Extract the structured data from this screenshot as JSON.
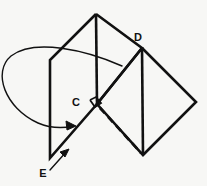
{
  "figure": {
    "background_color": "#f7f7f5",
    "stroke_color": "#111111",
    "canvas": {
      "width": 207,
      "height": 186
    },
    "labels": [
      {
        "id": "label-D",
        "text": "D",
        "x": 138,
        "y": 41
      },
      {
        "id": "label-C",
        "text": "C",
        "x": 76,
        "y": 106
      },
      {
        "id": "label-E",
        "text": "E",
        "x": 43,
        "y": 177
      }
    ],
    "shapes": {
      "left_plane": {
        "name": "left-rhombus",
        "points": "96,14 142,48 97,104 50,158 50,60 96,14",
        "outline": "96,14 50,60 50,158 97,104 142,48 96,14",
        "stroke_width": 2.6
      },
      "right_plane": {
        "name": "right-rhombus",
        "outline": "142,48 196,102 143,155 97,104 142,48",
        "stroke_width": 2.6
      },
      "vertical_edge_left": {
        "name": "left-plane-center-edge",
        "x1": 96,
        "y1": 14,
        "x2": 97,
        "y2": 104,
        "stroke_width": 2.6
      },
      "vertical_edge_right": {
        "name": "right-plane-center-edge",
        "x1": 142,
        "y1": 48,
        "x2": 143,
        "y2": 155,
        "stroke_width": 2.6
      },
      "hidden_edge": {
        "name": "hidden-fold-edge",
        "x1": 100,
        "y1": 108,
        "x2": 141,
        "y2": 153,
        "stroke_width": 2.6,
        "dash": "7 5"
      },
      "right_angle_marker": {
        "name": "right-angle-marker",
        "points": "90,100 96,97 101,103 95,107 90,100",
        "stroke_width": 1.6
      }
    },
    "arrows": {
      "curved_arrow": {
        "name": "curved-rotation-arrow",
        "path": "M 122,66 C 86,50 34,38 11,56 C -8,72 5,108 38,123 C 52,129 65,128 74,126",
        "stroke_width": 1.4,
        "head": "76,126 66,121 67,130 76,126"
      },
      "straight_arrow": {
        "name": "edge-pointer-arrow",
        "x1": 50,
        "y1": 170,
        "x2": 67,
        "y2": 151,
        "stroke_width": 1.4,
        "head": "69,149 60,152 65,157 69,149"
      }
    }
  }
}
